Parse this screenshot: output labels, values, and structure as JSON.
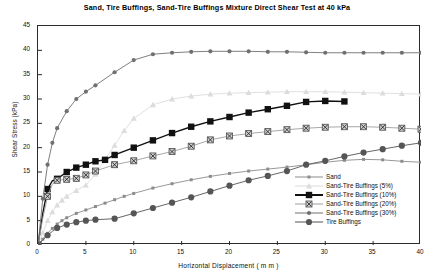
{
  "chart_data": {
    "type": "line",
    "title": "Sand, Tire Buffings, Sand-Tire Buffings Mixture Direct Shear Test at 40 kPa",
    "xlabel": "Horizontal Displacement ( m m )",
    "ylabel": "Shear Stress (kPa)",
    "xlim": [
      0,
      40
    ],
    "ylim": [
      0,
      45
    ],
    "xticks": [
      0,
      5,
      10,
      15,
      20,
      25,
      30,
      35,
      40
    ],
    "yticks": [
      0,
      5,
      10,
      15,
      20,
      25,
      30,
      35,
      40,
      45
    ],
    "grid": false,
    "legend_position": "inside-bottom-right",
    "series": [
      {
        "name": "Sand",
        "color": "#8c8c8c",
        "marker": "small-square",
        "x": [
          0,
          0.5,
          1,
          1.5,
          2,
          2.5,
          3,
          4,
          5,
          6,
          7,
          8,
          9,
          10,
          12,
          14,
          16,
          18,
          20,
          22,
          24,
          26,
          28,
          30,
          32,
          34,
          36,
          38,
          40
        ],
        "y": [
          0,
          1.2,
          2.4,
          3.4,
          4.3,
          5.0,
          5.6,
          6.5,
          7.2,
          7.9,
          8.6,
          9.3,
          10.0,
          10.6,
          11.7,
          12.6,
          13.4,
          14.1,
          14.7,
          15.2,
          15.6,
          16.0,
          16.5,
          17.0,
          17.4,
          17.6,
          17.5,
          17.2,
          17.0
        ]
      },
      {
        "name": "Sand-Tire Buffings (5%)",
        "color": "#dcdcdc",
        "marker": "triangle",
        "x": [
          0,
          0.5,
          1,
          1.5,
          2,
          2.5,
          3,
          4,
          5,
          6,
          7,
          8,
          9,
          10,
          12,
          14,
          16,
          18,
          20,
          22,
          24,
          26,
          28,
          30,
          32,
          34,
          36,
          38,
          40
        ],
        "y": [
          0,
          2.5,
          5.0,
          6.8,
          8.2,
          9.2,
          10.0,
          11.2,
          12.3,
          14.5,
          17.5,
          20.5,
          23.5,
          26.0,
          28.8,
          30.0,
          30.6,
          31.0,
          31.2,
          31.3,
          31.4,
          31.5,
          31.5,
          31.5,
          31.4,
          31.3,
          31.2,
          31.1,
          31.0
        ]
      },
      {
        "name": "Sand-Tire Buffings (10%)",
        "color": "#111111",
        "marker": "big-square",
        "x": [
          0,
          0.5,
          1,
          1.5,
          2,
          3,
          4,
          5,
          6,
          7,
          8,
          10,
          12,
          14,
          16,
          18,
          20,
          22,
          24,
          26,
          28,
          30,
          32
        ],
        "y": [
          0,
          6.5,
          11.5,
          13.2,
          13.6,
          15.0,
          15.9,
          16.5,
          17.2,
          17.5,
          18.5,
          20.0,
          21.5,
          23.0,
          24.3,
          25.4,
          26.3,
          27.2,
          27.9,
          28.6,
          29.4,
          29.6,
          29.5
        ]
      },
      {
        "name": "Sand-Tire Buffings (20%)",
        "color": "#9e9e9e",
        "marker": "boxed-x",
        "x": [
          0,
          0.5,
          1,
          1.5,
          2,
          3,
          4,
          5,
          6,
          8,
          10,
          12,
          14,
          16,
          18,
          20,
          22,
          24,
          26,
          28,
          30,
          32,
          34,
          36,
          38,
          40
        ],
        "y": [
          0,
          5.5,
          10.0,
          12.5,
          13.3,
          13.5,
          13.7,
          14.4,
          15.2,
          16.5,
          17.3,
          18.3,
          19.2,
          20.3,
          21.6,
          22.4,
          22.9,
          23.3,
          23.7,
          24.0,
          24.2,
          24.3,
          24.3,
          24.2,
          24.0,
          23.8
        ]
      },
      {
        "name": "Sand-Tire Buffings (30%)",
        "color": "#707070",
        "marker": "tiny-circle",
        "x": [
          0,
          0.5,
          1,
          1.5,
          2,
          3,
          4,
          5,
          6,
          8,
          10,
          12,
          14,
          16,
          18,
          20,
          22,
          24,
          26,
          28,
          30,
          32,
          34,
          36,
          38,
          40
        ],
        "y": [
          0,
          9.5,
          16.5,
          21.0,
          24.0,
          27.5,
          30.0,
          31.5,
          32.8,
          35.5,
          38.0,
          39.2,
          39.5,
          39.7,
          39.8,
          39.8,
          39.8,
          39.7,
          39.7,
          39.6,
          39.5,
          39.5,
          39.5,
          39.5,
          39.5,
          39.5
        ]
      },
      {
        "name": "Tire Buffings",
        "color": "#555555",
        "marker": "filled-circle",
        "x": [
          0,
          0.5,
          1,
          1.5,
          2,
          3,
          4,
          5,
          6,
          8,
          10,
          12,
          14,
          16,
          18,
          20,
          22,
          24,
          26,
          28,
          30,
          32,
          34,
          36,
          38,
          40
        ],
        "y": [
          0,
          1.0,
          2.0,
          2.8,
          3.5,
          4.2,
          4.7,
          5.0,
          5.2,
          5.4,
          6.5,
          7.6,
          8.7,
          9.8,
          11.0,
          12.2,
          13.3,
          14.2,
          15.2,
          16.5,
          17.3,
          18.2,
          19.0,
          19.7,
          20.4,
          21.0
        ]
      }
    ]
  },
  "legend": {
    "items": [
      {
        "label": "Sand"
      },
      {
        "label": "Sand-Tire Buffings (5%)"
      },
      {
        "label": "Sand-Tire Buffings (10%)"
      },
      {
        "label": "Sand-Tire Buffings (20%)"
      },
      {
        "label": "Sand-Tire Buffings (30%)"
      },
      {
        "label": "Tire Buffings"
      }
    ]
  }
}
